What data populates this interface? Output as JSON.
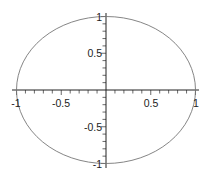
{
  "chart_data": {
    "type": "line",
    "title": "",
    "xlabel": "",
    "ylabel": "",
    "xlim": [
      -1,
      1
    ],
    "ylim": [
      -1,
      1
    ],
    "grid": false,
    "legend": null,
    "axes_style": "centered-at-origin",
    "series": [
      {
        "name": "unit circle",
        "equation": "x^2 + y^2 = 1",
        "color": "#777777",
        "x": [
          1,
          0.866,
          0.5,
          0,
          -0.5,
          -0.866,
          -1,
          -0.866,
          -0.5,
          0,
          0.5,
          0.866,
          1
        ],
        "y": [
          0,
          0.5,
          0.866,
          1,
          0.866,
          0.5,
          0,
          -0.5,
          -0.866,
          -1,
          -0.866,
          -0.5,
          0
        ]
      }
    ],
    "x_tick_labels": [
      "-1",
      "-0.5",
      "0.5",
      "1"
    ],
    "x_tick_values": [
      -1,
      -0.5,
      0.5,
      1
    ],
    "y_tick_labels": [
      "1",
      "0.5",
      "-0.5",
      "-1"
    ],
    "y_tick_values": [
      1,
      0.5,
      -0.5,
      -1
    ],
    "minor_tick_step": 0.1
  }
}
